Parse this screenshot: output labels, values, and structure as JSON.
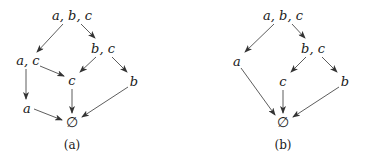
{
  "diagrams": [
    {
      "id": "a",
      "caption": "(a)",
      "nodes": [
        {
          "key": "abc",
          "label": "a, b, c",
          "x": 72,
          "y": 15
        },
        {
          "key": "bc",
          "label": "b, c",
          "x": 103,
          "y": 48
        },
        {
          "key": "ac",
          "label": "a, c",
          "x": 28,
          "y": 60
        },
        {
          "key": "c",
          "label": "c",
          "x": 72,
          "y": 80
        },
        {
          "key": "b",
          "label": "b",
          "x": 134,
          "y": 81
        },
        {
          "key": "a",
          "label": "a",
          "x": 27,
          "y": 108
        },
        {
          "key": "empty",
          "label": "∅",
          "x": 72,
          "y": 122
        }
      ],
      "edges": [
        {
          "from": "abc",
          "to": "ac",
          "x1": 63,
          "y1": 24,
          "x2": 37,
          "y2": 52
        },
        {
          "from": "abc",
          "to": "bc",
          "x1": 81,
          "y1": 24,
          "x2": 95,
          "y2": 38
        },
        {
          "from": "bc",
          "to": "c",
          "x1": 96,
          "y1": 57,
          "x2": 80,
          "y2": 72
        },
        {
          "from": "bc",
          "to": "b",
          "x1": 112,
          "y1": 57,
          "x2": 127,
          "y2": 72
        },
        {
          "from": "ac",
          "to": "c",
          "x1": 40,
          "y1": 66,
          "x2": 64,
          "y2": 76
        },
        {
          "from": "ac",
          "to": "a",
          "x1": 26,
          "y1": 69,
          "x2": 26,
          "y2": 99
        },
        {
          "from": "c",
          "to": "empty",
          "x1": 72,
          "y1": 89,
          "x2": 72,
          "y2": 113
        },
        {
          "from": "b",
          "to": "empty",
          "x1": 128,
          "y1": 87,
          "x2": 82,
          "y2": 117
        },
        {
          "from": "a",
          "to": "empty",
          "x1": 34,
          "y1": 109,
          "x2": 62,
          "y2": 120
        }
      ],
      "caption_pos": {
        "x": 72,
        "y": 145
      }
    },
    {
      "id": "b",
      "caption": "(b)",
      "nodes": [
        {
          "key": "abc",
          "label": "a, b, c",
          "x": 283,
          "y": 15
        },
        {
          "key": "bc",
          "label": "b, c",
          "x": 313,
          "y": 48
        },
        {
          "key": "a",
          "label": "a",
          "x": 237,
          "y": 61
        },
        {
          "key": "c",
          "label": "c",
          "x": 283,
          "y": 81
        },
        {
          "key": "b",
          "label": "b",
          "x": 345,
          "y": 81
        },
        {
          "key": "empty",
          "label": "∅",
          "x": 283,
          "y": 122
        }
      ],
      "edges": [
        {
          "from": "abc",
          "to": "a",
          "x1": 274,
          "y1": 24,
          "x2": 245,
          "y2": 52
        },
        {
          "from": "abc",
          "to": "bc",
          "x1": 292,
          "y1": 24,
          "x2": 305,
          "y2": 38
        },
        {
          "from": "bc",
          "to": "c",
          "x1": 306,
          "y1": 57,
          "x2": 291,
          "y2": 72
        },
        {
          "from": "bc",
          "to": "b",
          "x1": 322,
          "y1": 57,
          "x2": 337,
          "y2": 72
        },
        {
          "from": "a",
          "to": "empty",
          "x1": 241,
          "y1": 68,
          "x2": 275,
          "y2": 115
        },
        {
          "from": "c",
          "to": "empty",
          "x1": 283,
          "y1": 90,
          "x2": 283,
          "y2": 113
        },
        {
          "from": "b",
          "to": "empty",
          "x1": 339,
          "y1": 87,
          "x2": 293,
          "y2": 117
        }
      ],
      "caption_pos": {
        "x": 283,
        "y": 145
      }
    }
  ],
  "style": {
    "edge_color": "#333333",
    "text_color": "#1a1a1a",
    "background": "#ffffff"
  }
}
